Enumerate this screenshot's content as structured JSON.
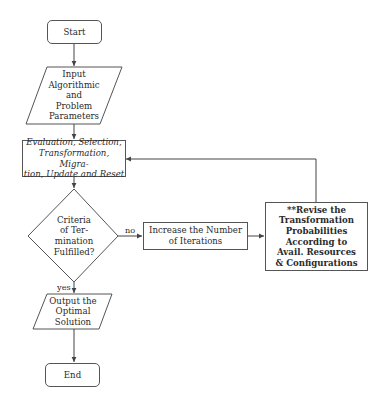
{
  "diagram": {
    "type": "flowchart",
    "nodes": {
      "start": {
        "label": "Start",
        "shape": "rounded-rectangle"
      },
      "input": {
        "lines": [
          "Input",
          "Algorithmic",
          "and",
          "Problem",
          "Parameters"
        ],
        "shape": "parallelogram"
      },
      "process": {
        "lines": [
          "Evaluation, Selection,",
          "Transformation, Migra-",
          "tion, Update and Reset"
        ],
        "shape": "rectangle",
        "style": "italic"
      },
      "decision": {
        "lines": [
          "Criteria",
          "of Ter-",
          "mination",
          "Fulfilled?"
        ],
        "shape": "diamond"
      },
      "increase": {
        "lines": [
          "Increase the Number",
          "of Iterations"
        ],
        "shape": "rectangle"
      },
      "revise": {
        "lines": [
          "**Revise the",
          "Transformation",
          "Probabilities",
          "According to",
          "Avail. Resources",
          "& Configurations"
        ],
        "shape": "rectangle",
        "style": "bold"
      },
      "output": {
        "lines": [
          "Output the",
          "Optimal",
          "Solution"
        ],
        "shape": "parallelogram"
      },
      "end": {
        "label": "End",
        "shape": "rounded-rectangle"
      }
    },
    "edges": [
      {
        "from": "start",
        "to": "input",
        "label": ""
      },
      {
        "from": "input",
        "to": "process",
        "label": ""
      },
      {
        "from": "process",
        "to": "decision",
        "label": ""
      },
      {
        "from": "decision",
        "to": "increase",
        "label": "no"
      },
      {
        "from": "increase",
        "to": "revise",
        "label": ""
      },
      {
        "from": "revise",
        "to": "process",
        "label": ""
      },
      {
        "from": "decision",
        "to": "output",
        "label": "yes"
      },
      {
        "from": "output",
        "to": "end",
        "label": ""
      }
    ],
    "edge_labels": {
      "no": "no",
      "yes": "yes"
    },
    "colors": {
      "stroke": "#555555",
      "text": "#2a2a2a",
      "background": "#ffffff"
    }
  }
}
